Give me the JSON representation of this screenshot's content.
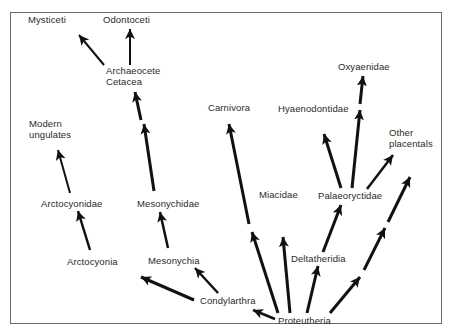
{
  "diagram": {
    "type": "phylogenetic-tree",
    "colors": {
      "background": "#ffffff",
      "frame": "#6b6b6b",
      "arrow": "#111111",
      "text": "#2a2a2a"
    },
    "nodes": [
      {
        "id": "mysticeti",
        "label": "Mysticeti",
        "x": 28,
        "y": 14
      },
      {
        "id": "odontoceti",
        "label": "Odontoceti",
        "x": 103,
        "y": 14
      },
      {
        "id": "archaeocete",
        "label": "Archaeocete",
        "x": 106,
        "y": 65
      },
      {
        "id": "cetacea",
        "label": "Cetacea",
        "x": 106,
        "y": 76
      },
      {
        "id": "modern",
        "label": "Modern",
        "x": 29,
        "y": 118
      },
      {
        "id": "ungulates",
        "label": "ungulates",
        "x": 29,
        "y": 129
      },
      {
        "id": "carnivora",
        "label": "Carnivora",
        "x": 208,
        "y": 102
      },
      {
        "id": "hyaenodontidae",
        "label": "Hyaenodontidae",
        "x": 278,
        "y": 103
      },
      {
        "id": "oxyaenidae",
        "label": "Oxyaenidae",
        "x": 338,
        "y": 61
      },
      {
        "id": "other",
        "label": "Other",
        "x": 389,
        "y": 127
      },
      {
        "id": "placentals",
        "label": "placentals",
        "x": 389,
        "y": 138
      },
      {
        "id": "arctocyonidae",
        "label": "Arctocyonidae",
        "x": 41,
        "y": 198
      },
      {
        "id": "mesonychidae",
        "label": "Mesonychidae",
        "x": 137,
        "y": 198
      },
      {
        "id": "miacidae",
        "label": "Miacidae",
        "x": 259,
        "y": 189
      },
      {
        "id": "palaeoryctidae",
        "label": "Palaeoryctidae",
        "x": 318,
        "y": 190
      },
      {
        "id": "arctocyonia",
        "label": "Arctocyonia",
        "x": 67,
        "y": 256
      },
      {
        "id": "mesonychia",
        "label": "Mesonychia",
        "x": 148,
        "y": 255
      },
      {
        "id": "deltatheridia",
        "label": "Deltatheridia",
        "x": 291,
        "y": 253
      },
      {
        "id": "condylarthra",
        "label": "Condylarthra",
        "x": 200,
        "y": 295
      },
      {
        "id": "proteutheria",
        "label": "Proteutheria",
        "x": 278,
        "y": 315
      }
    ],
    "edges": [
      {
        "from": "Archaeocete Cetacea",
        "to": "Mysticeti",
        "x1": 104,
        "y1": 65,
        "x2": 79,
        "y2": 35,
        "w": 2
      },
      {
        "from": "Archaeocete Cetacea",
        "to": "Odontoceti",
        "x1": 130,
        "y1": 65,
        "x2": 130,
        "y2": 29,
        "w": 2
      },
      {
        "from": "Mesonychidae",
        "to": "Archaeocete Cetacea (lower)",
        "x1": 154,
        "y1": 191,
        "x2": 144,
        "y2": 124,
        "w": 3
      },
      {
        "from": "Mesonychidae",
        "to": "Archaeocete Cetacea (upper)",
        "x1": 141,
        "y1": 120,
        "x2": 135,
        "y2": 92,
        "w": 3
      },
      {
        "from": "Arctocyonidae",
        "to": "Modern ungulates",
        "x1": 70,
        "y1": 193,
        "x2": 58,
        "y2": 150,
        "w": 2
      },
      {
        "from": "Arctocyonia",
        "to": "Arctocyonidae",
        "x1": 90,
        "y1": 250,
        "x2": 78,
        "y2": 211,
        "w": 2.5
      },
      {
        "from": "Mesonychia",
        "to": "Mesonychidae",
        "x1": 168,
        "y1": 248,
        "x2": 160,
        "y2": 212,
        "w": 2.5
      },
      {
        "from": "Condylarthra",
        "to": "Mesonychia",
        "x1": 218,
        "y1": 293,
        "x2": 195,
        "y2": 268,
        "w": 2.5
      },
      {
        "from": "Condylarthra",
        "to": "Arctocyonia",
        "x1": 194,
        "y1": 300,
        "x2": 141,
        "y2": 277,
        "w": 3
      },
      {
        "from": "Proteutheria",
        "to": "Condylarthra",
        "x1": 275,
        "y1": 319,
        "x2": 253,
        "y2": 310,
        "w": 2.5
      },
      {
        "from": "Proteutheria",
        "to": "Carnivora (lower)",
        "x1": 278,
        "y1": 313,
        "x2": 252,
        "y2": 232,
        "w": 3
      },
      {
        "from": "Proteutheria",
        "to": "Carnivora (upper)",
        "x1": 249,
        "y1": 224,
        "x2": 229,
        "y2": 124,
        "w": 3
      },
      {
        "from": "Proteutheria",
        "to": "Miacidae",
        "x1": 290,
        "y1": 313,
        "x2": 283,
        "y2": 237,
        "w": 3
      },
      {
        "from": "Proteutheria",
        "to": "Deltatheridia",
        "x1": 307,
        "y1": 313,
        "x2": 318,
        "y2": 266,
        "w": 3
      },
      {
        "from": "Deltatheridia",
        "to": "Palaeoryctidae",
        "x1": 323,
        "y1": 252,
        "x2": 341,
        "y2": 205,
        "w": 3
      },
      {
        "from": "Palaeoryctidae",
        "to": "Hyaenodontidae",
        "x1": 341,
        "y1": 188,
        "x2": 324,
        "y2": 134,
        "w": 3
      },
      {
        "from": "Palaeoryctidae",
        "to": "Oxyaenidae (lower)",
        "x1": 352,
        "y1": 188,
        "x2": 360,
        "y2": 110,
        "w": 3
      },
      {
        "from": "Palaeoryctidae",
        "to": "Oxyaenidae (upper)",
        "x1": 360,
        "y1": 104,
        "x2": 363,
        "y2": 76,
        "w": 3
      },
      {
        "from": "Palaeoryctidae",
        "to": "Other placentals",
        "x1": 367,
        "y1": 189,
        "x2": 393,
        "y2": 155,
        "w": 2.5
      },
      {
        "from": "Proteutheria",
        "to": "Other placentals (seg1)",
        "x1": 330,
        "y1": 313,
        "x2": 360,
        "y2": 277,
        "w": 3
      },
      {
        "from": "Proteutheria",
        "to": "Other placentals (seg2)",
        "x1": 364,
        "y1": 270,
        "x2": 385,
        "y2": 228,
        "w": 3
      },
      {
        "from": "Proteutheria",
        "to": "Other placentals (seg3)",
        "x1": 388,
        "y1": 222,
        "x2": 410,
        "y2": 177,
        "w": 3
      }
    ]
  }
}
